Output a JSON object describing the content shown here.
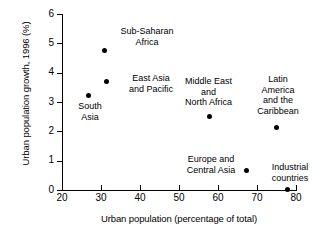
{
  "chart_data": {
    "type": "scatter",
    "title": "",
    "xlabel": "Urban population (percentage of total)",
    "ylabel": "Urban population growth, 1996 (%)",
    "xlim": [
      20,
      80
    ],
    "ylim": [
      0,
      6
    ],
    "xticks": [
      20,
      30,
      40,
      50,
      60,
      70,
      80
    ],
    "yticks": [
      0,
      1,
      2,
      3,
      4,
      5,
      6
    ],
    "grid": false,
    "legend": "none",
    "marker": "filled-circle",
    "marker_color": "#000000",
    "points": [
      {
        "label": "Sub-Saharan\nAfrica",
        "x": 31.0,
        "y": 4.75
      },
      {
        "label": "East Asia\nand Pacific",
        "x": 31.3,
        "y": 3.7
      },
      {
        "label": "South\nAsia",
        "x": 26.7,
        "y": 3.22
      },
      {
        "label": "Middle East\nand\nNorth Africa",
        "x": 57.7,
        "y": 2.5
      },
      {
        "label": "Latin\nAmerica\nand the\nCaribbean",
        "x": 75.1,
        "y": 2.13
      },
      {
        "label": "Europe and\nCentral Asia",
        "x": 67.4,
        "y": 0.66
      },
      {
        "label": "Industrial\ncountries",
        "x": 77.9,
        "y": 0.03
      }
    ]
  },
  "axis": {
    "x_tick_labels": [
      "20",
      "30",
      "40",
      "50",
      "60",
      "70",
      "80"
    ],
    "y_tick_labels": [
      "0",
      "1",
      "2",
      "3",
      "4",
      "5",
      "6"
    ]
  },
  "labels": {
    "sub_saharan_africa": "Sub-Saharan\nAfrica",
    "east_asia_pacific": "East Asia\nand Pacific",
    "south_asia": "South\nAsia",
    "middle_east_north_africa": "Middle East\nand\nNorth Africa",
    "latin_america_caribbean": "Latin\nAmerica\nand the\nCaribbean",
    "europe_central_asia": "Europe and\nCentral Asia",
    "industrial_countries": "Industrial\ncountries"
  }
}
